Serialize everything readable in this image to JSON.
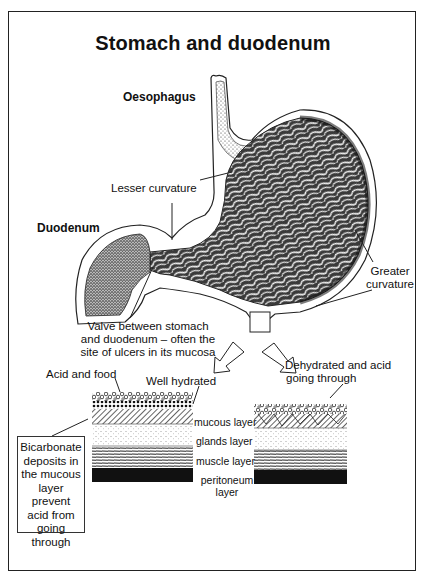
{
  "title": "Stomach and duodenum",
  "labels": {
    "oesophagus": "Oesophagus",
    "lesser_curvature": "Lesser curvature",
    "duodenum": "Duodenum",
    "greater_curvature": [
      "Greater",
      "curvature"
    ],
    "valve": [
      "Valve between stomach",
      "and duodenum – often the",
      "site of ulcers in its mucosa"
    ],
    "acid_and_food": "Acid and food",
    "well_hydrated": "Well hydrated",
    "dehydrated": [
      "Dehydrated and acid",
      "going through"
    ],
    "layers": {
      "mucous": "mucous layer",
      "glands": "glands layer",
      "muscle": "muscle layer",
      "peritoneum": [
        "peritoneum",
        "layer"
      ]
    },
    "bicarbonate_note": [
      "Bicarbonate",
      "deposits in",
      "the mucous",
      "layer prevent",
      "acid from",
      "going",
      "through"
    ]
  },
  "colors": {
    "ink": "#111111",
    "background": "#ffffff",
    "tissue_dark": "#2a2a2a",
    "tissue_mid": "#8a8a8a"
  }
}
